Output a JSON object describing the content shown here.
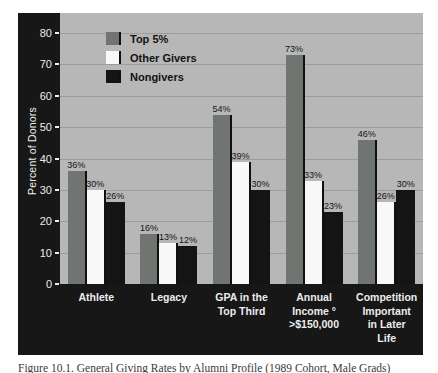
{
  "figure": {
    "caption": "Figure 10.1. General Giving Rates by Alumni Profile (1989 Cohort, Male Grads)"
  },
  "chart_data": {
    "type": "bar",
    "title": "",
    "xlabel": "",
    "ylabel": "Percent of Donors",
    "ylim": [
      0,
      80
    ],
    "yticks": [
      0,
      10,
      20,
      30,
      40,
      50,
      60,
      70,
      80
    ],
    "grid": true,
    "legend_position": "top-left-inside",
    "value_label_suffix": "%",
    "categories": [
      "Athlete",
      "Legacy",
      "GPA in the\nTop Third",
      "Annual\nIncome °\n>$150,000",
      "Competition\nImportant\nin Later\nLife"
    ],
    "series": [
      {
        "name": "Top 5%",
        "color": "#717571",
        "values": [
          36,
          16,
          54,
          73,
          46
        ]
      },
      {
        "name": "Other Givers",
        "color": "#f8f8f8",
        "values": [
          30,
          13,
          39,
          33,
          26
        ]
      },
      {
        "name": "Nongivers",
        "color": "#141414",
        "values": [
          26,
          12,
          30,
          23,
          30
        ]
      }
    ],
    "colors": {
      "frame": "#171717",
      "plot_background": "#b7b7b7",
      "gridline": "#9c9c9c",
      "axis_text": "#ededed",
      "value_label_text": "#141414"
    }
  }
}
